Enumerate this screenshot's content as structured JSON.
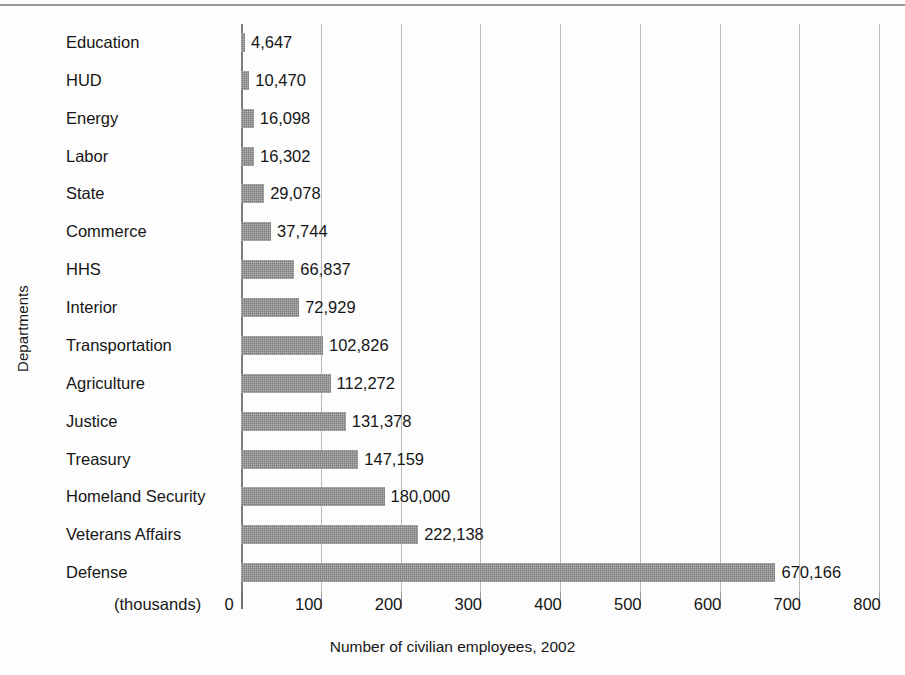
{
  "chart_data": {
    "type": "bar",
    "orientation": "horizontal",
    "title": "",
    "xlabel": "Number of civilian employees, 2002",
    "ylabel": "Departments",
    "x_unit_note": "(thousands)",
    "xlim": [
      0,
      800
    ],
    "x_ticks": [
      0,
      100,
      200,
      300,
      400,
      500,
      600,
      700,
      800
    ],
    "x_tick_labels": [
      "0",
      "100",
      "200",
      "300",
      "400",
      "500",
      "600",
      "700",
      "800"
    ],
    "x_tick_unit_scale": 1000,
    "grid": true,
    "legend": false,
    "bar_color": "#7b7b7b",
    "bar_texture": "checkered-halftone",
    "categories": [
      "Education",
      "HUD",
      "Energy",
      "Labor",
      "State",
      "Commerce",
      "HHS",
      "Interior",
      "Transportation",
      "Agriculture",
      "Justice",
      "Treasury",
      "Homeland Security",
      "Veterans Affairs",
      "Defense"
    ],
    "values": [
      4647,
      10470,
      16098,
      16302,
      29078,
      37744,
      66837,
      72929,
      102826,
      112272,
      131378,
      147159,
      180000,
      222138,
      670166
    ],
    "value_labels": [
      "4,647",
      "10,470",
      "16,098",
      "16,302",
      "29,078",
      "37,744",
      "66,837",
      "72,929",
      "102,826",
      "112,272",
      "131,378",
      "147,159",
      "180,000",
      "222,138",
      "670,166"
    ]
  }
}
